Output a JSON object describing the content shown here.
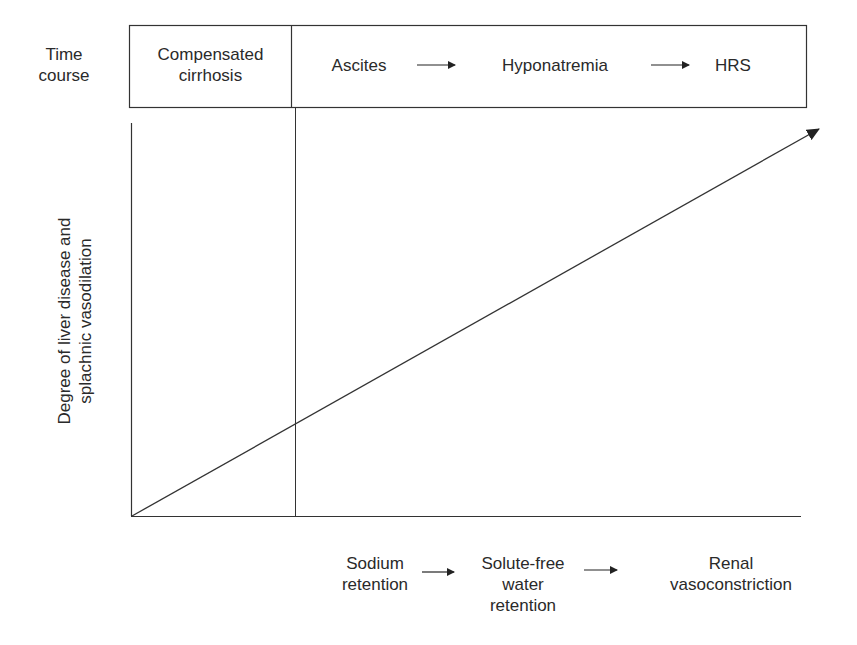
{
  "header": {
    "row_label_line1": "Time",
    "row_label_line2": "course",
    "stage1_line1": "Compensated",
    "stage1_line2": "cirrhosis",
    "stage2": "Ascites",
    "stage3": "Hyponatremia",
    "stage4": "HRS"
  },
  "y_axis": {
    "label_line1": "Degree of liver disease and",
    "label_line2": "splachnic vasodilation"
  },
  "bottom": {
    "item1_line1": "Sodium",
    "item1_line2": "retention",
    "item2_line1": "Solute-free",
    "item2_line2": "water",
    "item2_line3": "retention",
    "item3_line1": "Renal",
    "item3_line2": "vasoconstriction"
  },
  "colors": {
    "line": "#333333",
    "text": "#2a2a2a"
  }
}
